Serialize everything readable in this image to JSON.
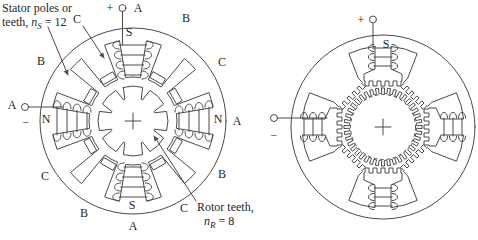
{
  "figure": {
    "left_motor": {
      "stator_note": {
        "line1": "Stator poles or",
        "line2_pre": "teeth, ",
        "line2_var": "n",
        "line2_sub": "S",
        "line2_post": " = 12"
      },
      "rotor_note": {
        "line1": "Rotor teeth,",
        "line2_var": "n",
        "line2_sub": "R",
        "line2_post": " = 8"
      },
      "plus": "+",
      "minus": "−",
      "phase_labels": {
        "top_a": "A",
        "upper_right_b": "B",
        "right_upper_c": "C",
        "right_a": "A",
        "lower_right_b": "B",
        "bottom_right_c": "C",
        "bottom_a": "A",
        "lower_left_b": "B",
        "left_lower_c": "C",
        "left_a": "A",
        "upper_left_b": "B",
        "top_left_c": "C"
      },
      "pole_marks": {
        "s_top": "S",
        "n_left": "N",
        "n_right": "N",
        "s_bottom": "S"
      }
    },
    "right_motor": {
      "plus": "+",
      "minus": "−",
      "pole_mark_s": "S"
    }
  }
}
